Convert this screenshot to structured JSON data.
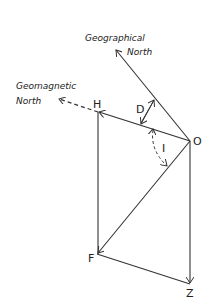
{
  "diagram": {
    "labels": {
      "geo_north_line1": "Geographical",
      "geo_north_line2": "North",
      "mag_north_line1": "Geomagnetic",
      "mag_north_line2": "North",
      "H": "H",
      "D": "D",
      "I": "I",
      "O": "O",
      "F": "F",
      "Z": "Z"
    },
    "points": {
      "O": [
        190,
        141
      ],
      "H": [
        98,
        112
      ],
      "F": [
        97,
        254
      ],
      "Z": [
        190,
        284
      ],
      "geo_north_tip": [
        115,
        49
      ],
      "mag_north_tip": [
        58,
        98
      ]
    },
    "colors": {
      "line": "#333333",
      "background": "#ffffff"
    }
  }
}
